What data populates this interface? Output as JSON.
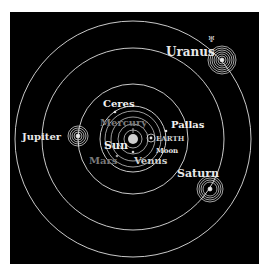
{
  "diagram": {
    "background": "#000000",
    "line_color": "#e8e8e8",
    "dim_label_color": "#7a7a7a",
    "bright_label_color": "#f2f2f2"
  },
  "bodies": {
    "sun": {
      "label": "Sun"
    },
    "mercury": {
      "label": "Mercury"
    },
    "venus": {
      "label": "Venus"
    },
    "earth": {
      "label": "EARTH"
    },
    "moon": {
      "label": "Moon"
    },
    "mars": {
      "label": "Mars"
    },
    "ceres": {
      "label": "Ceres"
    },
    "pallas": {
      "label": "Pallas"
    },
    "jupiter": {
      "label": "Jupiter"
    },
    "saturn": {
      "label": "Saturn"
    },
    "uranus": {
      "label": "Uranus"
    }
  },
  "symbols": {
    "ceres": "⚳",
    "pallas": "⚴",
    "jupiter": "♃",
    "saturn": "♄",
    "uranus": "♅",
    "earth": "♁"
  }
}
